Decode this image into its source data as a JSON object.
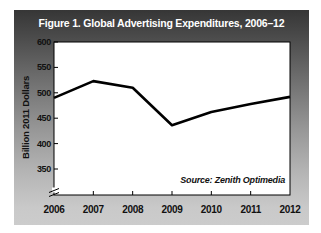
{
  "chart_data": {
    "type": "line",
    "title": "Figure 1. Global Advertising Expenditures, 2006–12",
    "categories": [
      "2006",
      "2007",
      "2008",
      "2009",
      "2010",
      "2011",
      "2012"
    ],
    "values": [
      490,
      523,
      510,
      436,
      462,
      478,
      492
    ],
    "ylabel": "Billion 2011 Dollars",
    "xlabel": "",
    "yticks": [
      600,
      550,
      500,
      450,
      400,
      350
    ],
    "ylim": [
      350,
      600
    ],
    "axis_break": true,
    "grid": false,
    "legend": "none",
    "source": "Source: Zenith Optimedia",
    "line_color": "#000000",
    "plot_bg": "#ffffff",
    "panel_gradient_top": "#363636",
    "panel_gradient_bottom": "#cccccc",
    "title_color": "#ffffff"
  }
}
